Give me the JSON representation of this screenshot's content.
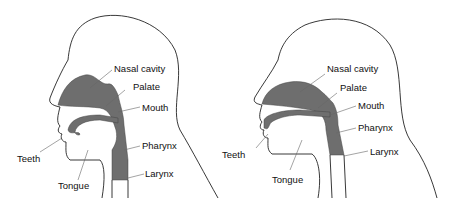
{
  "diagrams": [
    {
      "name": "left",
      "labels": {
        "nasal_cavity": "Nasal cavity",
        "palate": "Palate",
        "mouth": "Mouth",
        "pharynx": "Pharynx",
        "larynx": "Larynx",
        "teeth": "Teeth",
        "tongue": "Tongue"
      }
    },
    {
      "name": "right",
      "labels": {
        "nasal_cavity": "Nasal cavity",
        "palate": "Palate",
        "mouth": "Mouth",
        "pharynx": "Pharynx",
        "larynx": "Larynx",
        "teeth": "Teeth",
        "tongue": "Tongue"
      }
    }
  ],
  "colors": {
    "cavity": "#6e6e6e",
    "outline": "#222222"
  }
}
